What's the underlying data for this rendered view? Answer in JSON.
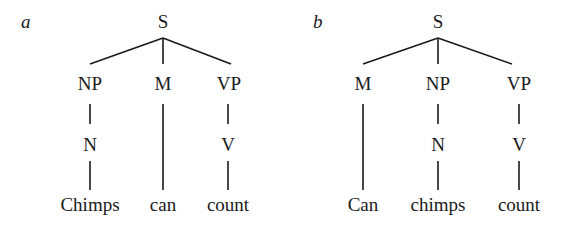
{
  "trees": [
    {
      "tag": "a",
      "root": "S",
      "level1": [
        "NP",
        "M",
        "VP"
      ],
      "level2": [
        "N",
        "",
        "V"
      ],
      "leaves": [
        "Chimps",
        "can",
        "count"
      ]
    },
    {
      "tag": "b",
      "root": "S",
      "level1": [
        "M",
        "NP",
        "VP"
      ],
      "level2": [
        "",
        "N",
        "V"
      ],
      "leaves": [
        "Can",
        "chimps",
        "count"
      ]
    }
  ]
}
